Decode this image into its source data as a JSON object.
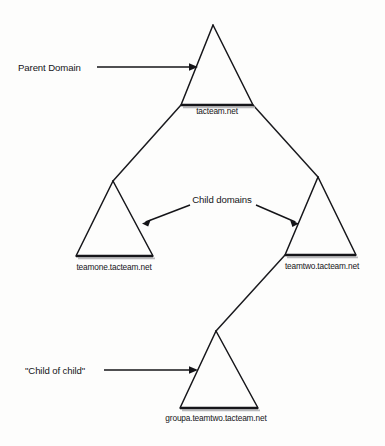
{
  "diagram": {
    "background_color": "#fdfdfc",
    "ink_color": "#16161a",
    "nodes": [
      {
        "id": "parent",
        "domain_label": "tacteam.net",
        "role": "Parent Domain",
        "level": 0,
        "apex": {
          "x": 213,
          "y": 25
        },
        "base_left": {
          "x": 181,
          "y": 105
        },
        "base_right": {
          "x": 253,
          "y": 105
        },
        "label_x": 217,
        "label_y": 114
      },
      {
        "id": "child-one",
        "domain_label": "teamone.tacteam.net",
        "role": "Child domain",
        "level": 1,
        "apex": {
          "x": 113,
          "y": 181
        },
        "base_left": {
          "x": 76,
          "y": 256
        },
        "base_right": {
          "x": 153,
          "y": 256
        },
        "label_x": 114,
        "label_y": 270
      },
      {
        "id": "child-two",
        "domain_label": "teamtwo.tacteam.net",
        "role": "Child domain",
        "level": 1,
        "apex": {
          "x": 318,
          "y": 177
        },
        "base_left": {
          "x": 285,
          "y": 255
        },
        "base_right": {
          "x": 356,
          "y": 255
        },
        "label_x": 322,
        "label_y": 269
      },
      {
        "id": "grandchild",
        "domain_label": "groupa.teamtwo.tacteam.net",
        "role": "Child of child",
        "level": 2,
        "apex": {
          "x": 216,
          "y": 331
        },
        "base_left": {
          "x": 180,
          "y": 408
        },
        "base_right": {
          "x": 258,
          "y": 408
        },
        "label_x": 216,
        "label_y": 421
      }
    ],
    "connectors": [
      {
        "id": "parent-to-child-one",
        "from": "parent",
        "to": "child-one",
        "x1": 181,
        "y1": 105,
        "x2": 113,
        "y2": 181
      },
      {
        "id": "parent-to-child-two",
        "from": "parent",
        "to": "child-two",
        "x1": 253,
        "y1": 105,
        "x2": 318,
        "y2": 177
      },
      {
        "id": "child-two-to-grandchild",
        "from": "child-two",
        "to": "grandchild",
        "x1": 285,
        "y1": 255,
        "x2": 216,
        "y2": 331
      }
    ],
    "annotations": [
      {
        "id": "parent-domain",
        "text": "Parent Domain",
        "text_x": 18,
        "text_y": 71,
        "text_anchor": "start",
        "line": {
          "x1": 97,
          "y1": 67,
          "x2": 191,
          "y2": 67
        },
        "arrow_tip": {
          "x": 198,
          "y": 67
        },
        "points_to": "parent"
      },
      {
        "id": "child-domains",
        "text": "Child domains",
        "text_x": 222,
        "text_y": 203,
        "text_anchor": "middle",
        "arrows": [
          {
            "id": "child-domains-left",
            "x1": 190,
            "y1": 205,
            "x2": 143,
            "y2": 223,
            "points_to": "child-one"
          },
          {
            "id": "child-domains-right",
            "x1": 256,
            "y1": 205,
            "x2": 298,
            "y2": 223,
            "points_to": "child-two"
          }
        ]
      },
      {
        "id": "child-of-child",
        "text": "\"Child of child\"",
        "text_x": 25,
        "text_y": 374,
        "text_anchor": "start",
        "line": {
          "x1": 104,
          "y1": 370,
          "x2": 191,
          "y2": 370
        },
        "arrow_tip": {
          "x": 198,
          "y": 370
        },
        "points_to": "grandchild"
      }
    ]
  }
}
